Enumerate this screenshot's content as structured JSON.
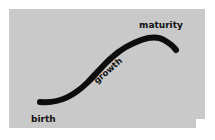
{
  "figure": {
    "canvas": {
      "width": 215,
      "height": 140,
      "page_background": "#ffffff"
    },
    "panel": {
      "background_color": "#c9c9c9",
      "x": 9,
      "y": 9,
      "width": 196,
      "height": 119,
      "notch": {
        "description": "small white square cut from bottom-right corner",
        "x": 196,
        "y": 119,
        "width": 9,
        "height": 9
      }
    },
    "curve": {
      "name": "s-curve",
      "shape": "sigmoid",
      "stroke_color": "#0d0d0d",
      "stroke_width": 6,
      "linecap": "round",
      "start_point": [
        40,
        102
      ],
      "inflection_point": [
        107,
        66
      ],
      "peak_point": [
        163,
        38
      ],
      "end_point": [
        176,
        50
      ]
    },
    "labels": [
      {
        "id": "birth",
        "text": "birth",
        "x": 31,
        "y": 122,
        "rotation": 0,
        "font_size": 9,
        "color": "#111111"
      },
      {
        "id": "growth",
        "text": "growth",
        "x": 97,
        "y": 84,
        "rotation": -41,
        "font_size": 8.5,
        "color": "#111111"
      },
      {
        "id": "maturity",
        "text": "maturity",
        "x": 139,
        "y": 28,
        "rotation": 0,
        "font_size": 9,
        "color": "#111111"
      }
    ]
  }
}
